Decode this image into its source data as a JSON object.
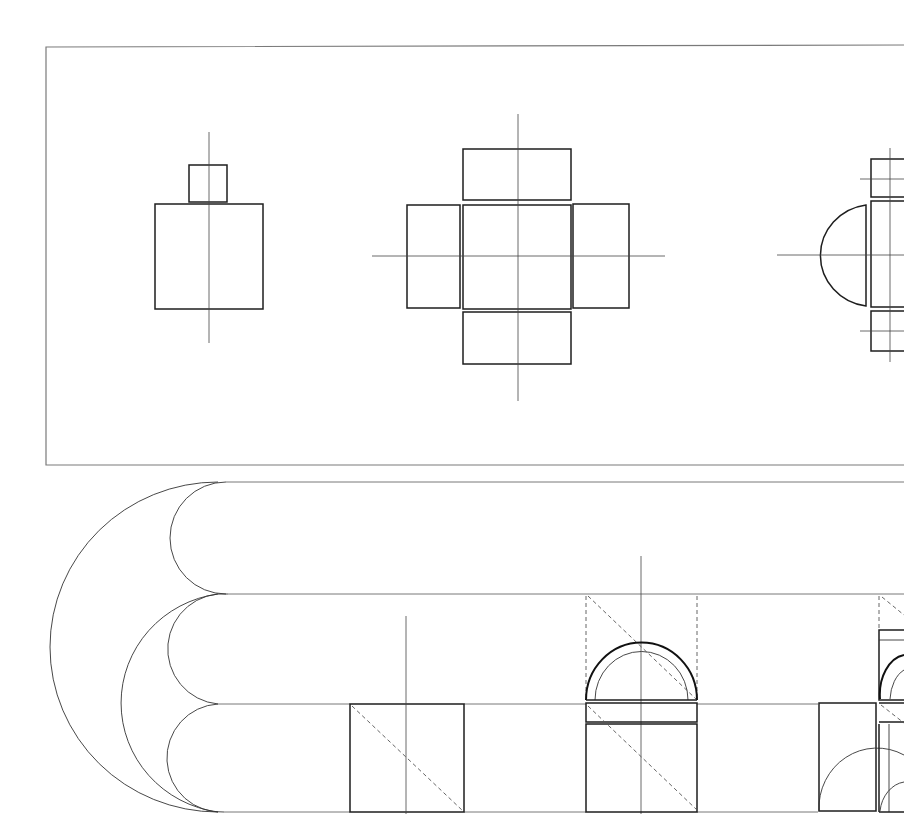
{
  "drawing": {
    "description": "Architectural composition diagram: plan figures on top panel, vaulted elevations on lower band",
    "colors": {
      "line": "#1e1e1e",
      "frame": "#7a7a7a",
      "background": "#ffffff"
    },
    "top_panel": {
      "frame": {
        "x": 46,
        "y": 46,
        "right_edge": "cropped",
        "bottom": 465
      },
      "figures": [
        {
          "name": "figure-1-square-with-small-square",
          "main_square": [
            155,
            204,
            263,
            309
          ],
          "small_square": [
            189,
            165,
            227,
            202
          ],
          "axis_x": 209
        },
        {
          "name": "figure-2-cross-of-rectangles",
          "center": [
            463,
            204,
            571,
            309
          ],
          "top": [
            463,
            149,
            571,
            200
          ],
          "bottom": [
            463,
            312,
            571,
            364
          ],
          "left": [
            407,
            205,
            460,
            308
          ],
          "right": [
            573,
            204,
            629,
            308
          ],
          "axis_x": 518,
          "axis_y": 256
        },
        {
          "name": "figure-3-half-circle-with-bars",
          "half_circle_center_y": 256,
          "axis_y": 256,
          "cropped": true
        }
      ]
    },
    "bottom_band": {
      "horizontal_lines_y": [
        482,
        594,
        704,
        812
      ],
      "arcs": "nested semicircular vault curves on left",
      "elements": [
        {
          "name": "square-with-diagonal",
          "rect": [
            350,
            704,
            464,
            812
          ]
        },
        {
          "name": "arched-block",
          "rect": [
            586,
            704,
            697,
            812
          ],
          "arch_top": 643
        },
        {
          "name": "cropped-group-right",
          "cropped": true
        }
      ]
    }
  }
}
